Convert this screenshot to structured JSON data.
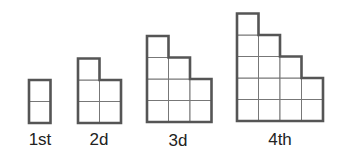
{
  "figures": [
    {
      "label": "1st",
      "column_heights": [
        2
      ]
    },
    {
      "label": "2d",
      "column_heights": [
        3,
        2
      ]
    },
    {
      "label": "3d",
      "column_heights": [
        4,
        3,
        2
      ]
    },
    {
      "label": "4th",
      "column_heights": [
        5,
        4,
        3,
        2
      ]
    }
  ],
  "colors": {
    "line": "#555555",
    "background": "#ffffff"
  }
}
